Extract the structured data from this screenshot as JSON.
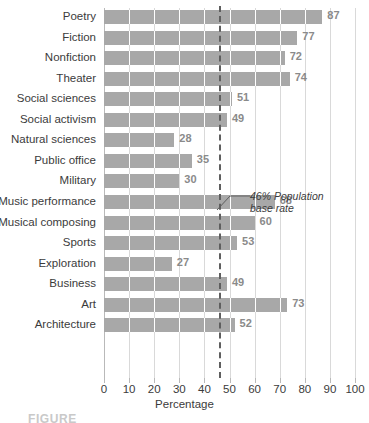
{
  "chart_data": {
    "type": "bar",
    "orientation": "horizontal",
    "title": "",
    "xlabel": "Percentage",
    "ylabel": "",
    "xlim": [
      0,
      100
    ],
    "xticks": [
      0,
      10,
      20,
      30,
      40,
      50,
      60,
      70,
      80,
      90,
      100
    ],
    "grid": true,
    "legend": "none",
    "categories": [
      "Poetry",
      "Fiction",
      "Nonfiction",
      "Theater",
      "Social sciences",
      "Social activism",
      "Natural sciences",
      "Public office",
      "Military",
      "Music performance",
      "Musical composing",
      "Sports",
      "Exploration",
      "Business",
      "Art",
      "Architecture"
    ],
    "values": [
      87,
      77,
      72,
      74,
      51,
      49,
      28,
      35,
      30,
      68,
      60,
      53,
      27,
      49,
      73,
      52
    ],
    "value_labels": [
      "87",
      "77",
      "72",
      "74",
      "51",
      "49",
      "28",
      "35",
      "30",
      "68",
      "60",
      "53",
      "27",
      "49",
      "73",
      "52"
    ],
    "bar_color": "#a8a8a8",
    "reference_line": {
      "value": 46,
      "label_line1": "46% Population",
      "label_line2": "base rate",
      "style": "dashed",
      "color": "#5e5e5e"
    }
  },
  "caption": {
    "text": "FIGURE"
  }
}
